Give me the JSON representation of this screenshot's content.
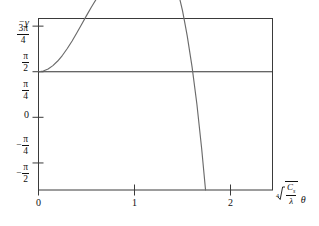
{
  "figure": {
    "background": "#ffffff",
    "axis_color": "#3a3a3a",
    "curve_color": "#6b6b6b",
    "grid_solid_color": "#dcdcdc",
    "grid_dotted_color": "#555555",
    "zero_line_color": "#333333"
  },
  "labels": {
    "y_axis_name_minus": "−",
    "y_axis_name_symbol": "γ",
    "x_axis_root_index": "4",
    "x_axis_numerator": "C",
    "x_axis_numerator_sub": "s",
    "x_axis_denominator": "λ",
    "x_axis_theta": "θ",
    "y_ticks": [
      {
        "value": 2.356,
        "text": "3π/4",
        "numerator": "3π",
        "denominator": "4",
        "sign": ""
      },
      {
        "value": 1.571,
        "text": "π/2",
        "numerator": "π",
        "denominator": "2",
        "sign": ""
      },
      {
        "value": 0.785,
        "text": "π/4",
        "numerator": "π",
        "denominator": "4",
        "sign": ""
      },
      {
        "value": 0.0,
        "text": "0",
        "numerator": "",
        "denominator": "",
        "sign": ""
      },
      {
        "value": -0.785,
        "text": "−π/4",
        "numerator": "π",
        "denominator": "4",
        "sign": "−"
      },
      {
        "value": -1.571,
        "text": "−π/2",
        "numerator": "π",
        "denominator": "2",
        "sign": "−"
      }
    ],
    "x_ticks": [
      {
        "value": 0,
        "text": "0"
      },
      {
        "value": 1,
        "text": "1"
      },
      {
        "value": 2,
        "text": "2"
      }
    ]
  },
  "chart_data": {
    "type": "line",
    "title": "",
    "subtitle": "",
    "xlabel": "4th-root(C_s / lambda) * theta",
    "ylabel": "-gamma (radians)",
    "xlim": [
      0,
      2.4375
    ],
    "ylim": [
      -2.0366,
      0.9163
    ],
    "y_axis_unit": "radians (multiples of pi/4)",
    "grid": {
      "x": false,
      "y": true,
      "lines": [
        {
          "y": 2.356,
          "label": "3π/4",
          "style": "solid",
          "color": "#dcdcdc"
        },
        {
          "y": 1.571,
          "label": "π/2",
          "style": "dotted",
          "color": "#555555"
        },
        {
          "y": 0.0,
          "label": "0",
          "style": "solid",
          "color": "#333333"
        }
      ]
    },
    "legend": {
      "show": false,
      "position": "none"
    },
    "annotations": [],
    "series": [
      {
        "name": "-gamma(theta)",
        "comment": "phase of the contrast transfer function; y values given in radians",
        "peak": {
          "x": 1.11,
          "y": 2.356
        },
        "zero_crossings": [
          0.0,
          1.53
        ],
        "x": [
          0.0,
          0.05,
          0.1,
          0.15,
          0.2,
          0.25,
          0.3,
          0.35,
          0.4,
          0.45,
          0.5,
          0.55,
          0.6,
          0.65,
          0.7,
          0.75,
          0.8,
          0.85,
          0.9,
          0.95,
          1.0,
          1.05,
          1.11,
          1.15,
          1.2,
          1.25,
          1.3,
          1.35,
          1.4,
          1.45,
          1.5,
          1.53,
          1.55,
          1.6,
          1.65,
          1.7,
          1.74
        ],
        "y": [
          0.0,
          0.012,
          0.047,
          0.105,
          0.184,
          0.283,
          0.399,
          0.53,
          0.671,
          0.818,
          0.966,
          1.11,
          1.245,
          1.367,
          1.65,
          1.79,
          1.955,
          2.09,
          2.2,
          2.285,
          2.34,
          2.356,
          2.356,
          2.34,
          2.29,
          2.205,
          2.08,
          1.91,
          1.69,
          1.405,
          1.05,
          0.79,
          0.61,
          0.08,
          -0.56,
          -1.33,
          -2.037
        ]
      }
    ]
  }
}
